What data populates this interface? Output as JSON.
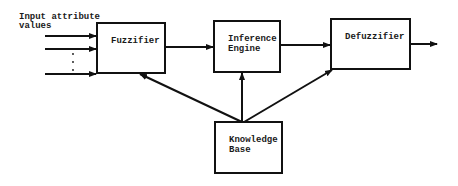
{
  "diagram": {
    "type": "block-diagram",
    "input_label": [
      "Input attribute",
      "values"
    ],
    "input_dots": ".\n.\n.",
    "nodes": [
      {
        "id": "fuzzifier",
        "lines": [
          "Fuzzifier"
        ]
      },
      {
        "id": "inference_engine",
        "lines": [
          "Inference",
          "Engine"
        ]
      },
      {
        "id": "defuzzifier",
        "lines": [
          "Defuzzifier"
        ]
      },
      {
        "id": "knowledge_base",
        "lines": [
          "Knowledge",
          "Base"
        ]
      }
    ],
    "edges": [
      {
        "from": "inputs",
        "to": "fuzzifier",
        "count": 3
      },
      {
        "from": "fuzzifier",
        "to": "inference_engine"
      },
      {
        "from": "inference_engine",
        "to": "defuzzifier"
      },
      {
        "from": "defuzzifier",
        "to": "output"
      },
      {
        "from": "knowledge_base",
        "to": "fuzzifier"
      },
      {
        "from": "knowledge_base",
        "to": "inference_engine"
      },
      {
        "from": "knowledge_base",
        "to": "defuzzifier"
      }
    ],
    "colors": {
      "stroke": "#111111",
      "background": "#ffffff"
    }
  }
}
